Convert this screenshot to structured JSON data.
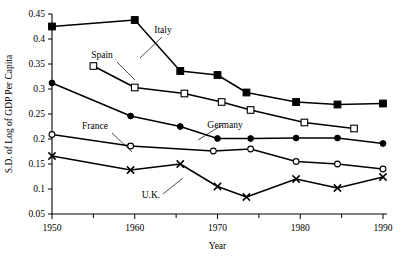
{
  "chart_data": {
    "type": "line",
    "title": "",
    "xlabel": "Year",
    "ylabel": "S.D. of Log of GDP Per Capita",
    "xlim": [
      1950,
      1990
    ],
    "ylim": [
      0.05,
      0.45
    ],
    "grid": false,
    "legend_position": "inline-annotations",
    "xticks": [
      1950,
      1960,
      1970,
      1980,
      1990
    ],
    "xtick_labels": [
      "1950",
      "1960",
      "1970",
      "1980",
      "1990"
    ],
    "xminorticks": [
      1955,
      1965,
      1975,
      1985
    ],
    "yticks": [
      0.05,
      0.1,
      0.15,
      0.2,
      0.25,
      0.3,
      0.35,
      0.4,
      0.45
    ],
    "ytick_labels": [
      "0.05",
      "0.1",
      "0.15",
      "0.2",
      "0.25",
      "0.3",
      "0.35",
      "0.4",
      "0.45"
    ],
    "series": [
      {
        "name": "Italy",
        "marker": "filled-square",
        "x": [
          1950,
          1960,
          1965.5,
          1970,
          1973.5,
          1979.5,
          1984.5,
          1990
        ],
        "values": [
          0.425,
          0.438,
          0.336,
          0.328,
          0.293,
          0.274,
          0.269,
          0.271
        ]
      },
      {
        "name": "Spain",
        "marker": "open-square",
        "x": [
          1955,
          1960,
          1966,
          1970.5,
          1974,
          1980.5,
          1986.5
        ],
        "values": [
          0.346,
          0.303,
          0.291,
          0.274,
          0.258,
          0.233,
          0.221
        ]
      },
      {
        "name": "Germany",
        "marker": "filled-circle",
        "x": [
          1950,
          1959.5,
          1965.5,
          1970,
          1974,
          1979.5,
          1984.5,
          1990
        ],
        "values": [
          0.312,
          0.246,
          0.225,
          0.201,
          0.201,
          0.202,
          0.202,
          0.191
        ]
      },
      {
        "name": "France",
        "marker": "open-circle",
        "x": [
          1950,
          1959.5,
          1969.5,
          1974,
          1979.5,
          1984.5,
          1990
        ],
        "values": [
          0.209,
          0.186,
          0.176,
          0.18,
          0.155,
          0.15,
          0.14
        ]
      },
      {
        "name": "U.K.",
        "marker": "cross",
        "x": [
          1950,
          1959.5,
          1965.5,
          1970,
          1973.5,
          1979.5,
          1984.5,
          1990
        ],
        "values": [
          0.166,
          0.138,
          0.15,
          0.105,
          0.084,
          0.12,
          0.102,
          0.124
        ]
      }
    ],
    "annotations": [
      {
        "text": "Italy",
        "label_x": 163,
        "label_y": 33,
        "leader_from": [
          162,
          37
        ],
        "leader_to": [
          140,
          58
        ]
      },
      {
        "text": "Spain",
        "label_x": 102,
        "label_y": 58,
        "leader_from": [
          117,
          62
        ],
        "leader_to": [
          135,
          80
        ]
      },
      {
        "text": "France",
        "label_x": 95,
        "label_y": 129,
        "leader_from": [
          112,
          133
        ],
        "leader_to": [
          132,
          152
        ]
      },
      {
        "text": "Germany",
        "label_x": 225,
        "label_y": 128,
        "leader_from": [
          222,
          125
        ],
        "leader_to": [
          198,
          140
        ]
      },
      {
        "text": "U.K.",
        "label_x": 151,
        "label_y": 198,
        "leader_from": [
          163,
          194
        ],
        "leader_to": [
          183,
          178
        ]
      }
    ]
  }
}
